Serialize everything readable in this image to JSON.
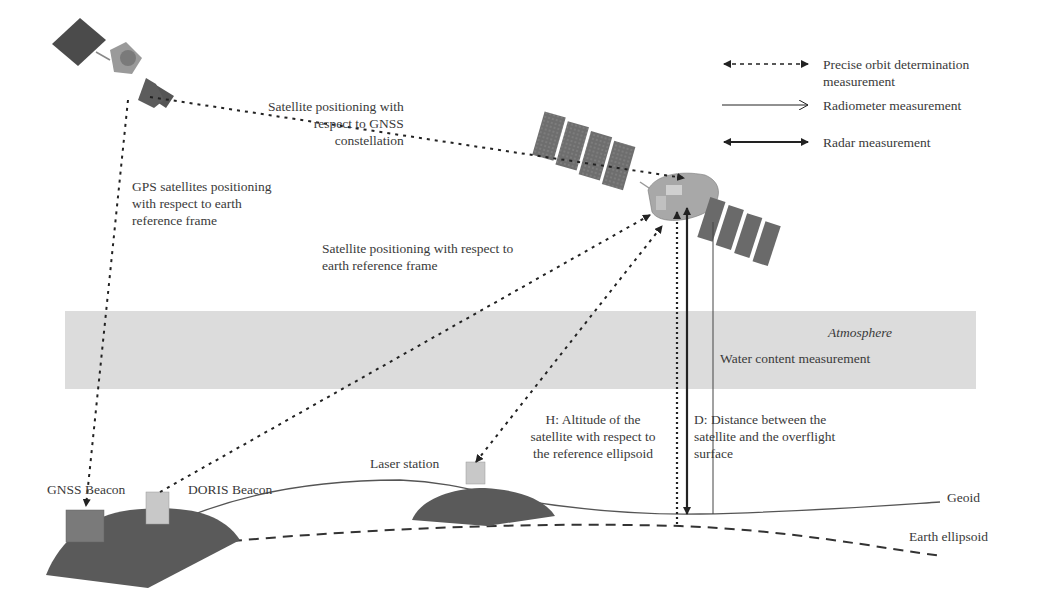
{
  "diagram": {
    "title_labels": {
      "gnss_constellation": "Satellite positioning with\nrespect to GNSS\nconstellation",
      "gps_positioning": "GPS satellites positioning\nwith respect to earth\nreference frame",
      "sat_positioning_earth": "Satellite positioning with respect to\nearth reference frame",
      "altitude_h": "H: Altitude of the\nsatellite with respect to\nthe reference ellipsoid",
      "distance_d": "D: Distance between the\nsatellite and the overflight\nsurface"
    },
    "atmosphere": {
      "title": "Atmosphere",
      "measurement": "Water content measurement",
      "color": "#dcdcdc"
    },
    "ground": {
      "gnss_beacon": "GNSS Beacon",
      "doris_beacon": "DORIS Beacon",
      "laser_station": "Laser station",
      "geoid": "Geoid",
      "earth_ellipsoid": "Earth ellipsoid",
      "land_color": "#5a5a5a",
      "beacon_dark_color": "#7a7a7a",
      "beacon_light_color": "#c8c8c8"
    },
    "legend": {
      "items": [
        {
          "style": "dotted-double-arrow",
          "label": "Precise orbit determination\nmeasurement"
        },
        {
          "style": "thin-single-arrow",
          "label": "Radiometer measurement"
        },
        {
          "style": "bold-double-arrow",
          "label": "Radar measurement"
        }
      ]
    },
    "objects": {
      "gps_satellite": "gps-satellite-icon",
      "altimetry_satellite": "altimetry-satellite-icon"
    }
  }
}
